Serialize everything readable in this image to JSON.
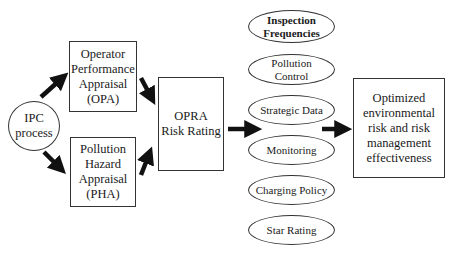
{
  "diagram": {
    "nodes": {
      "ipc": {
        "label": "IPC\nprocess",
        "shape": "circle"
      },
      "opa": {
        "label": "Operator\nPerformance\nAppraisal\n(OPA)",
        "shape": "rectangle"
      },
      "pha": {
        "label": "Pollution\nHazard\nAppraisal\n(PHA)",
        "shape": "rectangle"
      },
      "opra": {
        "label": "OPRA\nRisk Rating",
        "shape": "rectangle"
      },
      "outputs": [
        {
          "label": "Inspection\nFrequencies",
          "bold": true
        },
        {
          "label": "Pollution\nControl",
          "bold": false
        },
        {
          "label": "Strategic Data",
          "bold": false
        },
        {
          "label": "Monitoring",
          "bold": false
        },
        {
          "label": "Charging Policy",
          "bold": false
        },
        {
          "label": "Star Rating",
          "bold": false
        }
      ],
      "result": {
        "label": "Optimized\nenvironmental\nrisk and risk\nmanagement\neffectiveness",
        "shape": "rectangle"
      }
    },
    "edges": [
      {
        "from": "IPC process",
        "to": "Operator Performance Appraisal (OPA)"
      },
      {
        "from": "IPC process",
        "to": "Pollution Hazard Appraisal (PHA)"
      },
      {
        "from": "Operator Performance Appraisal (OPA)",
        "to": "OPRA Risk Rating"
      },
      {
        "from": "Pollution Hazard Appraisal (PHA)",
        "to": "OPRA Risk Rating"
      },
      {
        "from": "OPRA Risk Rating",
        "to": "Outputs"
      },
      {
        "from": "Outputs",
        "to": "Optimized environmental risk and risk management effectiveness"
      }
    ],
    "colors": {
      "stroke": "#333333",
      "arrow": "#111111",
      "background": "#ffffff"
    }
  }
}
